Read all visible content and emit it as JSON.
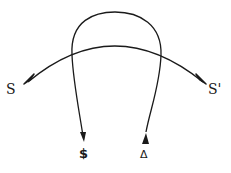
{
  "diagram": {
    "labels": {
      "left_end": "S",
      "right_end": "S'",
      "arch_left_end": "$",
      "arch_right_end": "Δ"
    },
    "edges": [
      {
        "name": "arc-s-to-s-prime",
        "from": "S",
        "to": "S'",
        "arrowheads": [
          "S",
          "S'"
        ]
      },
      {
        "name": "arch-dollar-delta",
        "from": "Δ",
        "to": "$",
        "arrowheads": [
          "$",
          "Δ"
        ]
      }
    ],
    "colors": {
      "stroke": "#1a1a1a",
      "background": "#ffffff"
    }
  }
}
